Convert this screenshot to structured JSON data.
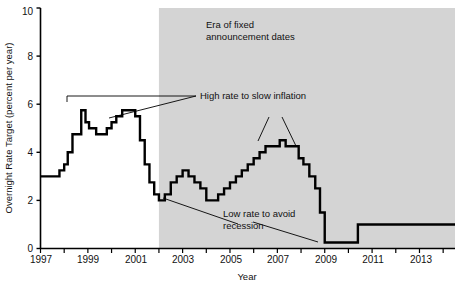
{
  "chart_data": {
    "type": "line",
    "title": "",
    "xlabel": "Year",
    "ylabel": "Overnight Rate Target (percent per year)",
    "xlim": [
      1997,
      2014.5
    ],
    "ylim": [
      0,
      10
    ],
    "yticks": [
      0,
      2,
      4,
      6,
      8,
      10
    ],
    "ytick_labels": [
      "0",
      "2",
      "4",
      "6",
      "8",
      "10"
    ],
    "xticks": [
      1997,
      1998,
      1999,
      2000,
      2001,
      2002,
      2003,
      2004,
      2005,
      2006,
      2007,
      2008,
      2009,
      2010,
      2011,
      2012,
      2013,
      2014
    ],
    "xtick_labels": [
      "1997",
      "",
      "1999",
      "",
      "2001",
      "",
      "2003",
      "",
      "2005",
      "",
      "2007",
      "",
      "2009",
      "",
      "2011",
      "",
      "2013",
      ""
    ],
    "grid": false,
    "legend": "none",
    "step_style": "post",
    "series": [
      {
        "name": "Overnight Rate Target",
        "color": "#000000",
        "x": [
          1997.0,
          1997.55,
          1997.8,
          1998.0,
          1998.15,
          1998.35,
          1998.6,
          1998.72,
          1998.9,
          1999.05,
          1999.35,
          1999.6,
          1999.8,
          2000.0,
          2000.2,
          2000.45,
          2000.7,
          2001.0,
          2001.2,
          2001.4,
          2001.6,
          2001.8,
          2002.0,
          2002.25,
          2002.5,
          2002.75,
          2003.0,
          2003.25,
          2003.5,
          2003.75,
          2004.0,
          2004.25,
          2004.5,
          2004.75,
          2005.0,
          2005.25,
          2005.5,
          2005.75,
          2006.0,
          2006.25,
          2006.5,
          2006.9,
          2007.1,
          2007.35,
          2007.6,
          2007.9,
          2008.1,
          2008.35,
          2008.6,
          2008.8,
          2009.0,
          2010.4,
          2014.5
        ],
        "y": [
          3.0,
          3.0,
          3.25,
          3.5,
          4.0,
          4.75,
          4.75,
          5.75,
          5.25,
          5.0,
          4.75,
          4.75,
          5.0,
          5.25,
          5.5,
          5.75,
          5.75,
          5.5,
          4.5,
          3.5,
          2.75,
          2.25,
          2.0,
          2.25,
          2.75,
          3.0,
          3.25,
          3.0,
          2.75,
          2.5,
          2.0,
          2.0,
          2.25,
          2.5,
          2.75,
          3.0,
          3.25,
          3.5,
          3.75,
          4.0,
          4.25,
          4.25,
          4.5,
          4.25,
          4.25,
          3.75,
          3.5,
          3.0,
          2.5,
          1.5,
          0.25,
          1.0,
          1.0
        ]
      }
    ],
    "shaded_region": {
      "label": "Era of fixed announcement dates",
      "x_start": 2002.0,
      "x_end": 2014.5,
      "color": "#d4d4d4"
    },
    "annotations": [
      {
        "text": "High rate to slow inflation",
        "target_years": [
          1998.3,
          2000.3
        ]
      },
      {
        "text": "Low rate to avoid recession",
        "target_years": [
          2002.0,
          2009.0
        ]
      }
    ]
  },
  "axis": {
    "y_title": "Overnight Rate Target (percent per year)",
    "x_title": "Year",
    "y_tick_0": "0",
    "y_tick_2": "2",
    "y_tick_4": "4",
    "y_tick_6": "6",
    "y_tick_8": "8",
    "y_tick_10": "10",
    "x_tick_1997": "1997",
    "x_tick_1999": "1999",
    "x_tick_2001": "2001",
    "x_tick_2003": "2003",
    "x_tick_2005": "2005",
    "x_tick_2007": "2007",
    "x_tick_2009": "2009",
    "x_tick_2011": "2011",
    "x_tick_2013": "2013"
  },
  "annotations": {
    "era_line1": "Era of fixed",
    "era_line2": "announcement dates",
    "high_rate": "High rate to slow inflation",
    "low_rate_line1": "Low rate to avoid",
    "low_rate_line2": "recession"
  }
}
